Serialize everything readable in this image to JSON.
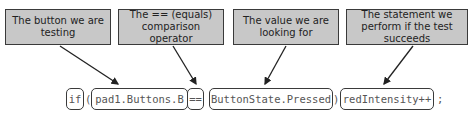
{
  "callouts": [
    {
      "text": "The button we are testing"
    },
    {
      "text": "The == (equals) comparison operator"
    },
    {
      "text": "The value we are looking for"
    },
    {
      "text": "The statement we perform if the test succeeds"
    }
  ],
  "code": {
    "if_keyword": "if",
    "open_paren": "(",
    "button": "pad1.Buttons.B",
    "operator": "==",
    "value": "ButtonState.Pressed",
    "close_paren": ")",
    "statement": "redIntensity++",
    "semicolon": ";"
  }
}
